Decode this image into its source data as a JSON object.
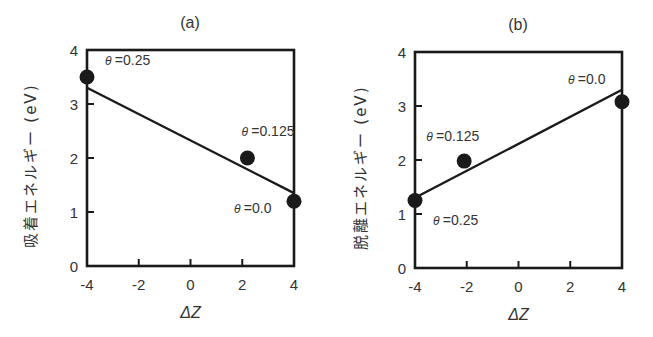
{
  "chart_data": [
    {
      "type": "scatter",
      "title": "(a)",
      "xlabel": "ΔZ",
      "ylabel": "吸着エネルギー (eV)",
      "xlim": [
        -4,
        4
      ],
      "ylim": [
        0,
        4
      ],
      "xticks": [
        -4,
        -2,
        0,
        2,
        4
      ],
      "yticks": [
        0,
        1,
        2,
        3,
        4
      ],
      "xtick_labels": [
        "-4",
        "-2",
        "0",
        "2",
        "4"
      ],
      "ytick_labels": [
        "0",
        "1",
        "2",
        "3",
        "4"
      ],
      "grid": false,
      "series": [
        {
          "name": "data",
          "points": [
            {
              "x": -4.0,
              "y": 3.5,
              "label": "θ =0.25"
            },
            {
              "x": 2.2,
              "y": 2.0,
              "label": "θ =0.125"
            },
            {
              "x": 4.0,
              "y": 1.2,
              "label": "θ =0.0"
            }
          ]
        },
        {
          "name": "linear fit",
          "type": "line",
          "x": [
            -4,
            4
          ],
          "y": [
            3.3,
            1.35
          ]
        }
      ]
    },
    {
      "type": "scatter",
      "title": "(b)",
      "xlabel": "ΔZ",
      "ylabel": "脱離エネルギー (eV)",
      "xlim": [
        -4,
        4
      ],
      "ylim": [
        0,
        4
      ],
      "xticks": [
        -4,
        -2,
        0,
        2,
        4
      ],
      "yticks": [
        0,
        1,
        2,
        3,
        4
      ],
      "xtick_labels": [
        "-4",
        "-2",
        "0",
        "2",
        "4"
      ],
      "ytick_labels": [
        "0",
        "1",
        "2",
        "3",
        "4"
      ],
      "grid": false,
      "series": [
        {
          "name": "data",
          "points": [
            {
              "x": -4.0,
              "y": 1.25,
              "label": "θ =0.25"
            },
            {
              "x": -2.1,
              "y": 1.98,
              "label": "θ =0.125"
            },
            {
              "x": 4.0,
              "y": 3.08,
              "label": "θ =0.0"
            }
          ]
        },
        {
          "name": "linear fit",
          "type": "line",
          "x": [
            -4,
            4
          ],
          "y": [
            1.3,
            3.3
          ]
        }
      ]
    }
  ],
  "layout": {
    "panels": [
      {
        "left": 87,
        "top": 50,
        "right": 294,
        "bottom": 266,
        "title_pos": [
          190,
          28
        ],
        "ylabel_x": 36,
        "xlabel_y": 318,
        "annot_offsets": [
          [
            18,
            -12
          ],
          [
            -6,
            -22
          ],
          [
            -60,
            12
          ]
        ]
      },
      {
        "left": 415,
        "top": 52,
        "right": 622,
        "bottom": 268,
        "title_pos": [
          518,
          30
        ],
        "ylabel_x": 366,
        "xlabel_y": 320,
        "annot_offsets": [
          [
            18,
            24
          ],
          [
            -38,
            -20
          ],
          [
            -54,
            -18
          ]
        ]
      }
    ],
    "colors": {
      "ink": "#1a1a1a",
      "text": "#333333",
      "background": "#ffffff"
    }
  }
}
